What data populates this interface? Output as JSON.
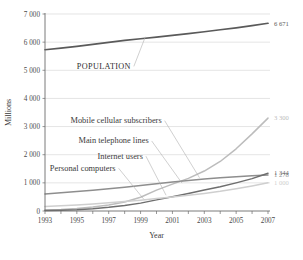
{
  "chart_data": {
    "type": "line",
    "title": "",
    "xlabel": "Year",
    "ylabel": "Millions",
    "xlim": [
      1993,
      2007
    ],
    "ylim": [
      0,
      7000
    ],
    "grid": true,
    "legend_position": "inline-annotations",
    "x": [
      1993,
      1994,
      1995,
      1996,
      1997,
      1998,
      1999,
      2000,
      2001,
      2002,
      2003,
      2004,
      2005,
      2006,
      2007
    ],
    "ytick_labels": [
      "0",
      "1 000",
      "2 000",
      "3 000",
      "4 000",
      "5 000",
      "6 000",
      "7 000"
    ],
    "ytick_values": [
      0,
      1000,
      2000,
      3000,
      4000,
      5000,
      6000,
      7000
    ],
    "xtick_labels": [
      "1993",
      "1995",
      "1997",
      "1999",
      "2001",
      "2003",
      "2005",
      "2007"
    ],
    "xtick_values": [
      1993,
      1995,
      1997,
      1999,
      2001,
      2003,
      2005,
      2007
    ],
    "series": [
      {
        "name": "POPULATION",
        "color": "#5a5a5a",
        "width": 1.7,
        "end_label": "6 671",
        "label_x": 1995.0,
        "label_y": 5050,
        "leader_to_x": 1999.3,
        "leader_to_y": 6190,
        "values": [
          5730,
          5790,
          5850,
          5920,
          5990,
          6060,
          6120,
          6180,
          6240,
          6300,
          6370,
          6440,
          6510,
          6590,
          6671
        ]
      },
      {
        "name": "Mobile cellular subscribers",
        "color": "#bcbcbc",
        "width": 1.5,
        "end_label": "3 300",
        "label_x": 1994.6,
        "label_y": 3120,
        "leader_to_x": 2002.7,
        "leader_to_y": 1180,
        "values": [
          34,
          55,
          91,
          145,
          215,
          318,
          490,
          740,
          955,
          1160,
          1420,
          1760,
          2210,
          2740,
          3300
        ]
      },
      {
        "name": "Main telephone lines",
        "color": "#8e8e8e",
        "width": 1.5,
        "end_label": "1 278",
        "label_x": 1995.1,
        "label_y": 2400,
        "leader_to_x": 2001.6,
        "leader_to_y": 990,
        "values": [
          606,
          645,
          690,
          740,
          790,
          845,
          905,
          970,
          1030,
          1085,
          1135,
          1185,
          1220,
          1252,
          1278
        ]
      },
      {
        "name": "Internet users",
        "color": "#6e6e6e",
        "width": 1.5,
        "end_label": "1 344",
        "label_x": 1996.3,
        "label_y": 1860,
        "leader_to_x": 2000.6,
        "leader_to_y": 560,
        "values": [
          14,
          25,
          44,
          80,
          130,
          195,
          280,
          395,
          505,
          625,
          745,
          860,
          1000,
          1150,
          1344
        ]
      },
      {
        "name": "Personal computers",
        "color": "#cfcfcf",
        "width": 1.5,
        "end_label": "1 000",
        "label_x": 1993.3,
        "label_y": 1430,
        "leader_to_x": 1999.2,
        "leader_to_y": 420,
        "values": [
          160,
          185,
          215,
          250,
          290,
          335,
          385,
          440,
          500,
          560,
          625,
          700,
          790,
          890,
          1000
        ]
      }
    ]
  }
}
